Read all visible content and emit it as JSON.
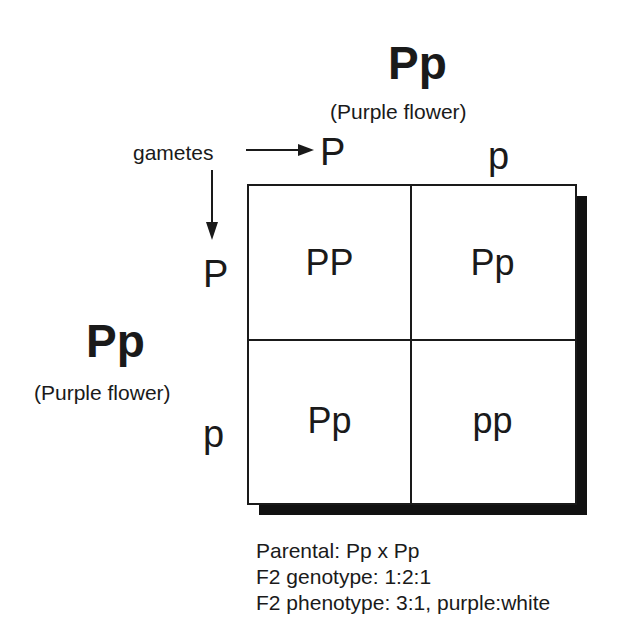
{
  "top_parent": {
    "genotype": "Pp",
    "phenotype": "(Purple flower)"
  },
  "left_parent": {
    "genotype": "Pp",
    "phenotype": "(Purple flower)"
  },
  "gametes_label": "gametes",
  "top_gametes": [
    "P",
    "p"
  ],
  "left_gametes": [
    "P",
    "p"
  ],
  "cells": [
    [
      "PP",
      "Pp"
    ],
    [
      "Pp",
      "pp"
    ]
  ],
  "notes": {
    "parental": "Parental: Pp x Pp",
    "genotype": "F2 genotype: 1:2:1",
    "phenotype": "F2 phenotype: 3:1, purple:white"
  },
  "colors": {
    "ink": "#1a1a1a",
    "shadow": "#111111",
    "background": "#ffffff"
  }
}
